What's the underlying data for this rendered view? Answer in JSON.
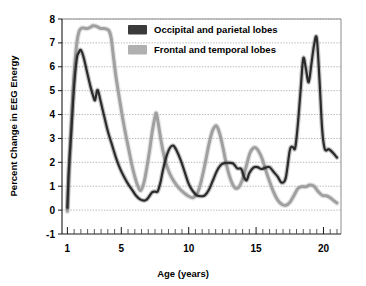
{
  "chart_data": {
    "type": "line",
    "title": "",
    "xlabel": "Age (years)",
    "ylabel": "Percent Change in EEG Energy",
    "xlim": [
      0.6,
      21.3
    ],
    "ylim": [
      -1,
      8
    ],
    "xticks": [
      1,
      5,
      10,
      15,
      20
    ],
    "xtick_labels": [
      "1",
      "5",
      "10",
      "15",
      "20"
    ],
    "yticks": [
      -1,
      0,
      1,
      2,
      3,
      4,
      5,
      6,
      7,
      8
    ],
    "ytick_labels": [
      "-1",
      "0",
      "1",
      "2",
      "3",
      "4",
      "5",
      "6",
      "7",
      "8"
    ],
    "grid": "horizontal-dotted",
    "legend_position": "top-center",
    "series": [
      {
        "name": "Occipital and parietal lobes",
        "color": "#2b2b2b",
        "swatch_color": "#3a3a3a",
        "x": [
          1.0,
          1.1,
          1.3,
          1.5,
          1.7,
          1.85,
          2.0,
          2.2,
          2.45,
          2.7,
          2.9,
          3.05,
          3.2,
          3.3,
          3.45,
          3.7,
          4.0,
          4.3,
          4.6,
          4.9,
          5.2,
          5.5,
          5.8,
          6.1,
          6.4,
          6.7,
          6.9,
          7.1,
          7.3,
          7.5,
          7.7,
          7.9,
          8.1,
          8.35,
          8.6,
          8.85,
          9.1,
          9.4,
          9.7,
          10.0,
          10.3,
          10.6,
          10.9,
          11.2,
          11.5,
          11.8,
          12.1,
          12.4,
          12.7,
          13.0,
          13.3,
          13.6,
          13.9,
          14.1,
          14.3,
          14.5,
          14.8,
          15.1,
          15.4,
          15.7,
          16.0,
          16.3,
          16.6,
          16.9,
          17.2,
          17.5,
          17.7,
          17.9,
          18.1,
          18.3,
          18.5,
          18.7,
          18.9,
          19.1,
          19.3,
          19.5,
          19.7,
          19.9,
          20.1,
          20.4,
          20.7,
          21.0
        ],
        "y": [
          0.1,
          1.6,
          3.4,
          5.2,
          6.35,
          6.6,
          6.7,
          6.4,
          5.8,
          5.2,
          4.8,
          4.6,
          5.0,
          4.95,
          4.6,
          4.0,
          3.3,
          2.75,
          2.2,
          1.75,
          1.4,
          1.1,
          0.85,
          0.6,
          0.45,
          0.4,
          0.45,
          0.6,
          0.75,
          0.78,
          0.78,
          1.15,
          1.7,
          2.25,
          2.6,
          2.7,
          2.5,
          2.1,
          1.6,
          1.1,
          0.8,
          0.62,
          0.58,
          0.62,
          0.85,
          1.25,
          1.65,
          1.9,
          1.97,
          1.98,
          1.95,
          1.75,
          1.72,
          1.4,
          1.25,
          1.55,
          1.78,
          1.8,
          1.72,
          1.78,
          1.8,
          1.6,
          1.4,
          1.15,
          1.35,
          2.5,
          2.65,
          2.6,
          3.6,
          5.0,
          6.35,
          5.9,
          5.35,
          6.1,
          6.9,
          7.2,
          5.5,
          3.4,
          2.55,
          2.55,
          2.4,
          2.2
        ]
      },
      {
        "name": "Frontal and temporal lobes",
        "color": "#a0a0a0",
        "swatch_color": "#b0b0b0",
        "x": [
          1.0,
          1.1,
          1.25,
          1.4,
          1.55,
          1.7,
          1.85,
          2.0,
          2.2,
          2.45,
          2.7,
          2.9,
          3.1,
          3.3,
          3.5,
          3.7,
          3.9,
          4.1,
          4.25,
          4.4,
          4.6,
          4.85,
          5.1,
          5.35,
          5.6,
          5.8,
          6.0,
          6.2,
          6.45,
          6.7,
          6.9,
          7.1,
          7.3,
          7.5,
          7.6,
          7.75,
          7.95,
          8.2,
          8.5,
          8.8,
          9.1,
          9.4,
          9.7,
          10.0,
          10.3,
          10.5,
          10.7,
          10.9,
          11.2,
          11.5,
          11.75,
          11.95,
          12.1,
          12.3,
          12.55,
          12.8,
          13.1,
          13.4,
          13.7,
          14.0,
          14.3,
          14.55,
          14.8,
          15.0,
          15.2,
          15.45,
          15.7,
          16.0,
          16.3,
          16.6,
          16.9,
          17.2,
          17.5,
          17.8,
          18.1,
          18.4,
          18.7,
          19.0,
          19.3,
          19.6,
          19.9,
          20.2,
          20.5,
          20.8,
          21.0
        ],
        "y": [
          -0.05,
          1.3,
          3.1,
          4.8,
          6.1,
          7.0,
          7.45,
          7.6,
          7.62,
          7.6,
          7.65,
          7.72,
          7.7,
          7.65,
          7.6,
          7.6,
          7.58,
          7.5,
          7.2,
          6.5,
          5.6,
          4.7,
          3.85,
          3.1,
          2.4,
          1.85,
          1.4,
          1.05,
          0.82,
          1.2,
          1.8,
          2.5,
          3.3,
          3.9,
          4.05,
          3.6,
          2.9,
          2.2,
          1.65,
          1.3,
          1.05,
          0.85,
          0.7,
          0.58,
          0.52,
          0.6,
          0.78,
          1.15,
          1.9,
          2.75,
          3.3,
          3.5,
          3.5,
          3.2,
          2.6,
          1.9,
          1.3,
          0.95,
          0.95,
          1.3,
          1.9,
          2.4,
          2.6,
          2.6,
          2.45,
          2.15,
          1.7,
          1.2,
          0.75,
          0.42,
          0.25,
          0.2,
          0.32,
          0.6,
          0.9,
          0.98,
          0.98,
          1.05,
          1.0,
          0.78,
          0.62,
          0.6,
          0.52,
          0.38,
          0.3
        ]
      }
    ]
  },
  "legend": {
    "items": [
      {
        "label": "Occipital and parietal lobes"
      },
      {
        "label": "Frontal and temporal lobes"
      }
    ]
  }
}
